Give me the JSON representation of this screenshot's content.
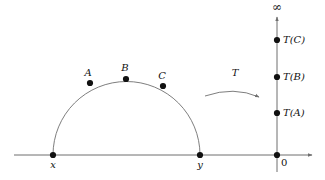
{
  "figure": {
    "colors": {
      "axis": "#6f6f6f",
      "curve": "#6f6f6f",
      "point": "#111111",
      "text": "#111111",
      "background": "#ffffff"
    },
    "geometry": {
      "baseline_y": 155,
      "baseline_x_start": 14,
      "baseline_x_end": 312,
      "semicircle": {
        "cx": 126.5,
        "cy": 155,
        "r": 73.5
      },
      "vertical_line_x": 277,
      "vertical_line_top": 17,
      "vertical_line_bottom": 172
    }
  },
  "domain_side": {
    "baseline_label_left": "x",
    "baseline_label_right": "y",
    "endpoints": [
      {
        "name": "x",
        "label": "x",
        "x": 53,
        "y": 155,
        "label_x": 53,
        "label_y": 160
      },
      {
        "name": "y",
        "label": "y",
        "x": 200,
        "y": 155,
        "label_x": 200,
        "label_y": 160
      }
    ],
    "arc_points": [
      {
        "name": "A",
        "label": "A",
        "x": 90,
        "y": 83,
        "label_x": 88,
        "label_y": 68
      },
      {
        "name": "B",
        "label": "B",
        "x": 126,
        "y": 79,
        "label_x": 125,
        "label_y": 63
      },
      {
        "name": "C",
        "label": "C",
        "x": 163,
        "y": 86,
        "label_x": 162,
        "label_y": 71
      }
    ]
  },
  "mapping": {
    "arrow_label": "T",
    "arrow_label_x": 235,
    "arrow_label_y": 68,
    "arrow_path": "M 205 96 Q 234 86 261 98",
    "arrow_tip": {
      "x": 261,
      "y": 98
    }
  },
  "range_side": {
    "top_symbol": "∞",
    "top_symbol_x": 277,
    "top_symbol_y": 2,
    "origin_label": "0",
    "origin_label_x": 281,
    "origin_label_y": 158,
    "origin": {
      "x": 277,
      "y": 155
    },
    "image_points": [
      {
        "name": "T(C)",
        "label": "T(C)",
        "x": 277,
        "y": 40,
        "label_x": 283,
        "label_y": 35
      },
      {
        "name": "T(B)",
        "label": "T(B)",
        "x": 277,
        "y": 77,
        "label_x": 283,
        "label_y": 72
      },
      {
        "name": "T(A)",
        "label": "T(A)",
        "x": 277,
        "y": 113,
        "label_x": 283,
        "label_y": 108
      }
    ]
  }
}
